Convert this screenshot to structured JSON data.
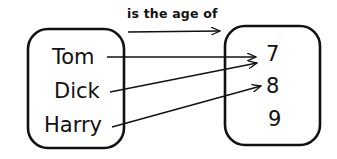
{
  "diagram": {
    "relation_label": "is the age of",
    "domain": {
      "items": [
        "Tom",
        "Dick",
        "Harry"
      ]
    },
    "codomain": {
      "items": [
        "7",
        "8",
        "9"
      ]
    },
    "mappings": [
      {
        "from": "Tom",
        "to": "7"
      },
      {
        "from": "Dick",
        "to": "7"
      },
      {
        "from": "Harry",
        "to": "8"
      }
    ],
    "colors": {
      "stroke": "#111111",
      "background": "#ffffff"
    }
  }
}
